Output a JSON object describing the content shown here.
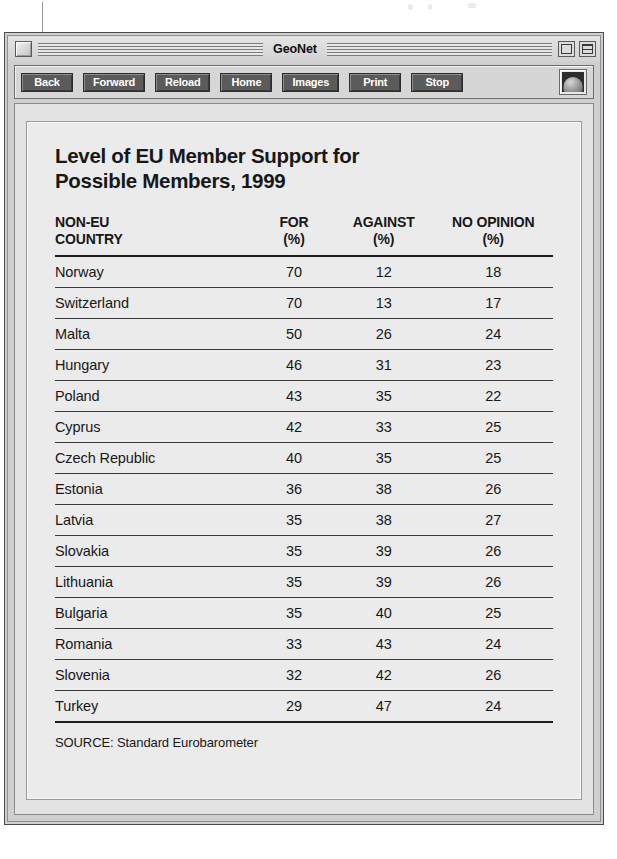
{
  "window": {
    "title": "GeoNet",
    "close_box": "close-box",
    "zoom_box": "zoom-box",
    "collapse_box": "collapse-box"
  },
  "toolbar": {
    "buttons": [
      {
        "label": "Back",
        "name": "back-button"
      },
      {
        "label": "Forward",
        "name": "forward-button"
      },
      {
        "label": "Reload",
        "name": "reload-button"
      },
      {
        "label": "Home",
        "name": "home-button"
      },
      {
        "label": "Images",
        "name": "images-button"
      },
      {
        "label": "Print",
        "name": "print-button"
      },
      {
        "label": "Stop",
        "name": "stop-button"
      }
    ],
    "logo_icon": "globe-dome-icon"
  },
  "document": {
    "title_line1": "Level of EU Member Support for",
    "title_line2": "Possible Members, 1999",
    "source": "SOURCE: Standard Eurobarometer"
  },
  "chart_data": {
    "type": "table",
    "title": "Level of EU Member Support for Possible Members, 1999",
    "columns": [
      {
        "line1": "NON-EU",
        "line2": "COUNTRY",
        "align": "left"
      },
      {
        "line1": "FOR",
        "line2": "(%)",
        "align": "center"
      },
      {
        "line1": "AGAINST",
        "line2": "(%)",
        "align": "center"
      },
      {
        "line1": "NO OPINION",
        "line2": "(%)",
        "align": "center"
      }
    ],
    "categories": [
      "Norway",
      "Switzerland",
      "Malta",
      "Hungary",
      "Poland",
      "Cyprus",
      "Czech Republic",
      "Estonia",
      "Latvia",
      "Slovakia",
      "Lithuania",
      "Bulgaria",
      "Romania",
      "Slovenia",
      "Turkey"
    ],
    "series": [
      {
        "name": "FOR (%)",
        "values": [
          70,
          70,
          50,
          46,
          43,
          42,
          40,
          36,
          35,
          35,
          35,
          35,
          33,
          32,
          29
        ]
      },
      {
        "name": "AGAINST (%)",
        "values": [
          12,
          13,
          26,
          31,
          35,
          33,
          35,
          38,
          38,
          39,
          39,
          40,
          43,
          42,
          47
        ]
      },
      {
        "name": "NO OPINION (%)",
        "values": [
          18,
          17,
          24,
          23,
          22,
          25,
          25,
          26,
          27,
          26,
          26,
          25,
          24,
          26,
          24
        ]
      }
    ],
    "rows": [
      {
        "country": "Norway",
        "for": 70,
        "against": 12,
        "no_opinion": 18
      },
      {
        "country": "Switzerland",
        "for": 70,
        "against": 13,
        "no_opinion": 17
      },
      {
        "country": "Malta",
        "for": 50,
        "against": 26,
        "no_opinion": 24
      },
      {
        "country": "Hungary",
        "for": 46,
        "against": 31,
        "no_opinion": 23
      },
      {
        "country": "Poland",
        "for": 43,
        "against": 35,
        "no_opinion": 22
      },
      {
        "country": "Cyprus",
        "for": 42,
        "against": 33,
        "no_opinion": 25
      },
      {
        "country": "Czech Republic",
        "for": 40,
        "against": 35,
        "no_opinion": 25
      },
      {
        "country": "Estonia",
        "for": 36,
        "against": 38,
        "no_opinion": 26
      },
      {
        "country": "Latvia",
        "for": 35,
        "against": 38,
        "no_opinion": 27
      },
      {
        "country": "Slovakia",
        "for": 35,
        "against": 39,
        "no_opinion": 26
      },
      {
        "country": "Lithuania",
        "for": 35,
        "against": 39,
        "no_opinion": 26
      },
      {
        "country": "Bulgaria",
        "for": 35,
        "against": 40,
        "no_opinion": 25
      },
      {
        "country": "Romania",
        "for": 33,
        "against": 43,
        "no_opinion": 24
      },
      {
        "country": "Slovenia",
        "for": 32,
        "against": 42,
        "no_opinion": 26
      },
      {
        "country": "Turkey",
        "for": 29,
        "against": 47,
        "no_opinion": 24
      }
    ],
    "source": "SOURCE: Standard Eurobarometer",
    "xlabel": "",
    "ylabel": "",
    "grid": false,
    "legend": "none"
  },
  "colors": {
    "window_chrome": "#cfcfcf",
    "toolbar_button": "#5b5b5b",
    "button_text": "#ffffff",
    "page_background": "#ebebeb",
    "text": "#16181a",
    "rule": "#3a3a3a"
  }
}
